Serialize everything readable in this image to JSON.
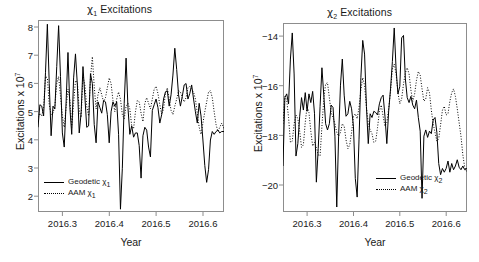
{
  "figure": {
    "background": "#ffffff",
    "line_color": "#000000",
    "frame_color": "#8d8d8d"
  },
  "panels": [
    {
      "id": "chi1",
      "title_prefix": "χ",
      "title_sub": "1",
      "title_suffix": " Excitations",
      "ylabel_prefix": "Excitations x 10",
      "ylabel_sup": "7",
      "xlabel": "Year",
      "yticks": [
        "8",
        "7",
        "6",
        "5",
        "4",
        "3",
        "2"
      ],
      "xticks": [
        "2016.3",
        "2016.4",
        "2016.5",
        "2016.6"
      ],
      "legend": [
        {
          "key": "solid",
          "label_prefix": "Geodetic χ",
          "label_sub": "1"
        },
        {
          "key": "dotted",
          "label_prefix": "AAM χ",
          "label_sub": "1"
        }
      ]
    },
    {
      "id": "chi2",
      "title_prefix": "χ",
      "title_sub": "2",
      "title_suffix": " Excitations",
      "ylabel_prefix": "Excitations x 10",
      "ylabel_sup": "7",
      "xlabel": "Year",
      "yticks": [
        "−14",
        "−16",
        "−18",
        "−20"
      ],
      "xticks": [
        "2016.3",
        "2016.4",
        "2016.5",
        "2016.6"
      ],
      "legend": [
        {
          "key": "solid",
          "label_prefix": "Geodetic χ",
          "label_sub": "2"
        },
        {
          "key": "dotted",
          "label_prefix": "AAM χ",
          "label_sub": "2"
        }
      ]
    }
  ],
  "chart_data": [
    {
      "type": "line",
      "id": "chi1",
      "title": "χ1 Excitations",
      "xlabel": "Year",
      "ylabel": "Excitations x 10^7",
      "xlim": [
        2016.248,
        2016.645
      ],
      "ylim": [
        1.55,
        8.35
      ],
      "xticks": [
        2016.3,
        2016.4,
        2016.5,
        2016.6
      ],
      "yticks": [
        2,
        3,
        4,
        5,
        6,
        7,
        8
      ],
      "grid": false,
      "legend_position": "bottom-left",
      "series": [
        {
          "name": "Geodetic χ1",
          "style": "solid",
          "x": [
            2016.248,
            2016.252,
            2016.256,
            2016.26,
            2016.264,
            2016.268,
            2016.272,
            2016.276,
            2016.28,
            2016.284,
            2016.288,
            2016.292,
            2016.296,
            2016.3,
            2016.304,
            2016.308,
            2016.312,
            2016.316,
            2016.32,
            2016.324,
            2016.328,
            2016.332,
            2016.336,
            2016.34,
            2016.344,
            2016.348,
            2016.352,
            2016.356,
            2016.36,
            2016.364,
            2016.368,
            2016.372,
            2016.376,
            2016.38,
            2016.384,
            2016.388,
            2016.392,
            2016.396,
            2016.4,
            2016.404,
            2016.408,
            2016.412,
            2016.416,
            2016.42,
            2016.424,
            2016.428,
            2016.432,
            2016.436,
            2016.44,
            2016.444,
            2016.448,
            2016.452,
            2016.456,
            2016.46,
            2016.464,
            2016.468,
            2016.472,
            2016.476,
            2016.48,
            2016.484,
            2016.488,
            2016.492,
            2016.496,
            2016.5,
            2016.504,
            2016.508,
            2016.512,
            2016.516,
            2016.52,
            2016.524,
            2016.528,
            2016.532,
            2016.536,
            2016.54,
            2016.544,
            2016.548,
            2016.552,
            2016.556,
            2016.56,
            2016.564,
            2016.568,
            2016.572,
            2016.576,
            2016.58,
            2016.584,
            2016.588,
            2016.592,
            2016.596,
            2016.6,
            2016.604,
            2016.608,
            2016.612,
            2016.616,
            2016.62,
            2016.624,
            2016.628,
            2016.632,
            2016.636,
            2016.64,
            2016.645
          ],
          "y": [
            4.55,
            5.35,
            5.3,
            4.95,
            6.5,
            8.2,
            6.1,
            4.25,
            5.3,
            5.2,
            6.7,
            8.15,
            6.35,
            4.35,
            3.85,
            5.45,
            7.2,
            5.25,
            4.3,
            6.3,
            7.15,
            6.05,
            4.35,
            5.05,
            6.7,
            5.65,
            4.55,
            4.6,
            6.45,
            6.1,
            4.65,
            4.0,
            5.45,
            5.25,
            5.05,
            5.5,
            5.45,
            5.0,
            4.0,
            5.1,
            5.45,
            5.3,
            5.45,
            4.3,
            1.65,
            3.1,
            5.4,
            7.0,
            5.25,
            4.3,
            4.6,
            4.2,
            4.35,
            4.35,
            3.9,
            2.75,
            4.25,
            4.55,
            4.45,
            3.85,
            3.5,
            5.15,
            5.35,
            5.55,
            5.25,
            4.7,
            5.0,
            5.55,
            5.8,
            5.85,
            5.3,
            5.7,
            6.4,
            7.35,
            6.6,
            5.7,
            5.3,
            5.65,
            6.05,
            6.1,
            5.55,
            5.75,
            6.05,
            5.55,
            5.1,
            4.7,
            5.4,
            4.95,
            4.1,
            3.2,
            2.6,
            3.05,
            4.1,
            4.4,
            4.3,
            4.4,
            4.45,
            4.35,
            4.4,
            4.4
          ]
        },
        {
          "name": "AAM χ1",
          "style": "dotted",
          "x": [
            2016.248,
            2016.252,
            2016.256,
            2016.26,
            2016.264,
            2016.268,
            2016.272,
            2016.276,
            2016.28,
            2016.284,
            2016.288,
            2016.292,
            2016.296,
            2016.3,
            2016.304,
            2016.308,
            2016.312,
            2016.316,
            2016.32,
            2016.324,
            2016.328,
            2016.332,
            2016.336,
            2016.34,
            2016.344,
            2016.348,
            2016.352,
            2016.356,
            2016.36,
            2016.364,
            2016.368,
            2016.372,
            2016.376,
            2016.38,
            2016.384,
            2016.388,
            2016.392,
            2016.396,
            2016.4,
            2016.404,
            2016.408,
            2016.412,
            2016.416,
            2016.42,
            2016.424,
            2016.428,
            2016.432,
            2016.436,
            2016.44,
            2016.444,
            2016.448,
            2016.452,
            2016.456,
            2016.46,
            2016.464,
            2016.468,
            2016.472,
            2016.476,
            2016.48,
            2016.484,
            2016.488,
            2016.492,
            2016.496,
            2016.5,
            2016.504,
            2016.508,
            2016.512,
            2016.516,
            2016.52,
            2016.524,
            2016.528,
            2016.532,
            2016.536,
            2016.54,
            2016.544,
            2016.548,
            2016.552,
            2016.556,
            2016.56,
            2016.564,
            2016.568,
            2016.572,
            2016.576,
            2016.58,
            2016.584,
            2016.588,
            2016.592,
            2016.596,
            2016.6,
            2016.604,
            2016.608,
            2016.612,
            2016.616,
            2016.62,
            2016.624,
            2016.628,
            2016.632,
            2016.636,
            2016.64,
            2016.645
          ],
          "y": [
            4.9,
            5.05,
            4.95,
            5.25,
            6.35,
            6.3,
            5.35,
            5.0,
            5.05,
            5.3,
            6.1,
            6.35,
            5.65,
            4.95,
            4.55,
            5.25,
            5.9,
            5.55,
            4.55,
            5.4,
            6.2,
            6.15,
            5.15,
            4.9,
            6.35,
            6.05,
            5.3,
            4.95,
            6.3,
            7.05,
            6.0,
            5.2,
            5.7,
            5.95,
            5.7,
            5.45,
            5.6,
            5.95,
            6.3,
            6.1,
            5.5,
            5.1,
            5.55,
            5.8,
            5.55,
            5.0,
            4.85,
            5.3,
            5.4,
            5.2,
            4.6,
            4.5,
            5.1,
            5.5,
            5.45,
            5.05,
            4.75,
            5.4,
            5.6,
            5.4,
            5.2,
            5.55,
            5.9,
            6.0,
            5.75,
            5.35,
            5.0,
            5.2,
            5.75,
            5.95,
            5.55,
            5.15,
            5.0,
            5.3,
            5.55,
            5.85,
            5.8,
            5.6,
            5.45,
            5.6,
            5.95,
            6.0,
            5.9,
            5.8,
            5.55,
            5.05,
            4.55,
            4.3,
            4.7,
            5.1,
            5.45,
            5.8,
            5.85,
            5.6,
            5.1,
            4.65,
            4.4,
            4.55,
            4.7,
            4.5
          ]
        }
      ]
    },
    {
      "type": "line",
      "id": "chi2",
      "title": "χ2 Excitations",
      "xlabel": "Year",
      "ylabel": "Excitations x 10^7",
      "xlim": [
        2016.248,
        2016.645
      ],
      "ylim": [
        -21.15,
        -13.55
      ],
      "xticks": [
        2016.3,
        2016.4,
        2016.5,
        2016.6
      ],
      "yticks": [
        -20,
        -18,
        -16,
        -14
      ],
      "grid": false,
      "legend_position": "bottom-right",
      "series": [
        {
          "name": "Geodetic χ2",
          "style": "solid",
          "x": [
            2016.248,
            2016.252,
            2016.256,
            2016.26,
            2016.264,
            2016.268,
            2016.272,
            2016.276,
            2016.28,
            2016.284,
            2016.288,
            2016.292,
            2016.296,
            2016.3,
            2016.304,
            2016.308,
            2016.312,
            2016.316,
            2016.32,
            2016.324,
            2016.328,
            2016.332,
            2016.336,
            2016.34,
            2016.344,
            2016.348,
            2016.352,
            2016.356,
            2016.36,
            2016.364,
            2016.368,
            2016.372,
            2016.376,
            2016.38,
            2016.384,
            2016.388,
            2016.392,
            2016.396,
            2016.4,
            2016.404,
            2016.408,
            2016.412,
            2016.416,
            2016.42,
            2016.424,
            2016.428,
            2016.432,
            2016.436,
            2016.44,
            2016.444,
            2016.448,
            2016.452,
            2016.456,
            2016.46,
            2016.464,
            2016.468,
            2016.472,
            2016.476,
            2016.48,
            2016.484,
            2016.488,
            2016.492,
            2016.496,
            2016.5,
            2016.504,
            2016.508,
            2016.512,
            2016.516,
            2016.52,
            2016.524,
            2016.528,
            2016.532,
            2016.536,
            2016.54,
            2016.544,
            2016.548,
            2016.552,
            2016.556,
            2016.56,
            2016.564,
            2016.568,
            2016.572,
            2016.576,
            2016.58,
            2016.584,
            2016.588,
            2016.592,
            2016.596,
            2016.6,
            2016.604,
            2016.608,
            2016.612,
            2016.616,
            2016.62,
            2016.624,
            2016.628,
            2016.632,
            2016.636,
            2016.64,
            2016.645
          ],
          "y": [
            -19.3,
            -16.55,
            -16.4,
            -16.8,
            -15.0,
            -13.95,
            -15.6,
            -18.9,
            -18.4,
            -17.3,
            -16.55,
            -17.05,
            -16.35,
            -17.1,
            -16.4,
            -16.75,
            -16.3,
            -17.2,
            -19.95,
            -18.6,
            -16.9,
            -15.35,
            -16.45,
            -17.6,
            -17.85,
            -17.6,
            -16.85,
            -16.95,
            -18.1,
            -20.95,
            -18.1,
            -16.05,
            -15.0,
            -16.45,
            -17.3,
            -17.2,
            -16.7,
            -17.0,
            -17.7,
            -19.8,
            -20.55,
            -18.25,
            -15.75,
            -14.25,
            -14.8,
            -16.9,
            -18.4,
            -17.2,
            -17.35,
            -17.1,
            -17.15,
            -17.25,
            -16.8,
            -16.55,
            -16.45,
            -17.3,
            -18.4,
            -17.1,
            -16.2,
            -15.1,
            -13.75,
            -15.4,
            -16.4,
            -16.1,
            -14.15,
            -14.05,
            -15.8,
            -16.55,
            -16.75,
            -16.5,
            -16.85,
            -17.0,
            -16.65,
            -17.35,
            -17.9,
            -20.6,
            -18.1,
            -17.85,
            -18.15,
            -17.9,
            -18.0,
            -17.45,
            -17.35,
            -17.95,
            -19.2,
            -19.65,
            -19.4,
            -19.55,
            -19.4,
            -19.1,
            -19.55,
            -19.2,
            -19.45,
            -19.3,
            -19.05,
            -19.35,
            -19.45,
            -19.3,
            -19.45,
            -19.4
          ]
        },
        {
          "name": "AAM χ2",
          "style": "dotted",
          "x": [
            2016.248,
            2016.252,
            2016.256,
            2016.26,
            2016.264,
            2016.268,
            2016.272,
            2016.276,
            2016.28,
            2016.284,
            2016.288,
            2016.292,
            2016.296,
            2016.3,
            2016.304,
            2016.308,
            2016.312,
            2016.316,
            2016.32,
            2016.324,
            2016.328,
            2016.332,
            2016.336,
            2016.34,
            2016.344,
            2016.348,
            2016.352,
            2016.356,
            2016.36,
            2016.364,
            2016.368,
            2016.372,
            2016.376,
            2016.38,
            2016.384,
            2016.388,
            2016.392,
            2016.396,
            2016.4,
            2016.404,
            2016.408,
            2016.412,
            2016.416,
            2016.42,
            2016.424,
            2016.428,
            2016.432,
            2016.436,
            2016.44,
            2016.444,
            2016.448,
            2016.452,
            2016.456,
            2016.46,
            2016.464,
            2016.468,
            2016.472,
            2016.476,
            2016.48,
            2016.484,
            2016.488,
            2016.492,
            2016.496,
            2016.5,
            2016.504,
            2016.508,
            2016.512,
            2016.516,
            2016.52,
            2016.524,
            2016.528,
            2016.532,
            2016.536,
            2016.54,
            2016.544,
            2016.548,
            2016.552,
            2016.556,
            2016.56,
            2016.564,
            2016.568,
            2016.572,
            2016.576,
            2016.58,
            2016.584,
            2016.588,
            2016.592,
            2016.596,
            2016.6,
            2016.604,
            2016.608,
            2016.612,
            2016.616,
            2016.62,
            2016.624,
            2016.628,
            2016.632,
            2016.636,
            2016.64,
            2016.645
          ],
          "y": [
            -17.6,
            -16.5,
            -16.65,
            -17.35,
            -18.35,
            -18.3,
            -17.6,
            -17.25,
            -17.4,
            -17.9,
            -18.55,
            -18.45,
            -17.55,
            -16.9,
            -17.15,
            -17.9,
            -18.5,
            -18.35,
            -18.55,
            -18.85,
            -18.9,
            -17.7,
            -16.6,
            -16.0,
            -15.95,
            -16.55,
            -17.15,
            -17.35,
            -17.6,
            -17.95,
            -18.1,
            -17.95,
            -17.6,
            -17.7,
            -18.25,
            -18.6,
            -18.45,
            -17.95,
            -17.3,
            -17.2,
            -17.4,
            -16.95,
            -16.25,
            -15.75,
            -16.05,
            -16.95,
            -17.6,
            -17.85,
            -18.0,
            -18.35,
            -18.3,
            -17.75,
            -17.1,
            -16.85,
            -17.3,
            -17.7,
            -17.55,
            -17.0,
            -16.3,
            -15.4,
            -15.2,
            -15.6,
            -16.35,
            -16.8,
            -16.6,
            -16.0,
            -15.55,
            -15.35,
            -15.6,
            -16.25,
            -16.7,
            -16.4,
            -15.85,
            -15.5,
            -15.65,
            -16.2,
            -16.7,
            -16.6,
            -16.15,
            -16.35,
            -17.05,
            -17.6,
            -17.95,
            -18.3,
            -18.2,
            -17.65,
            -17.05,
            -16.9,
            -17.25,
            -17.2,
            -16.7,
            -16.35,
            -16.2,
            -16.5,
            -17.0,
            -17.55,
            -18.1,
            -18.85,
            -19.35,
            -19.55
          ]
        }
      ]
    }
  ]
}
